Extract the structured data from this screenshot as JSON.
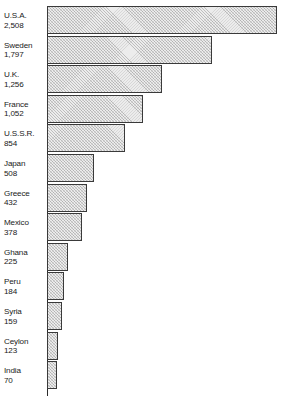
{
  "chart_data": {
    "type": "bar",
    "orientation": "horizontal",
    "title": "",
    "subtitle": "",
    "xlabel": "",
    "ylabel": "",
    "grid": false,
    "legend": null,
    "axis": {
      "baseline_value": 0,
      "xlim": [
        0,
        2508
      ]
    },
    "categories": [
      "U.S.A.",
      "Sweden",
      "U.K.",
      "France",
      "U.S.S.R.",
      "Japan",
      "Greece",
      "Mexico",
      "Ghana",
      "Peru",
      "Syria",
      "Ceylon",
      "India"
    ],
    "values": [
      2508,
      1797,
      1256,
      1052,
      854,
      508,
      432,
      378,
      225,
      184,
      159,
      123,
      70
    ],
    "value_labels": [
      "2,508",
      "1,797",
      "1,256",
      "1,052",
      "854",
      "508",
      "432",
      "378",
      "225",
      "184",
      "159",
      "123",
      "70"
    ],
    "bars": [
      {
        "name": "U.S.A.",
        "value": 2508,
        "label": "2,508"
      },
      {
        "name": "Sweden",
        "value": 1797,
        "label": "1,797"
      },
      {
        "name": "U.K.",
        "value": 1256,
        "label": "1,256"
      },
      {
        "name": "France",
        "value": 1052,
        "label": "1,052"
      },
      {
        "name": "U.S.S.R.",
        "value": 854,
        "label": "854"
      },
      {
        "name": "Japan",
        "value": 508,
        "label": "508"
      },
      {
        "name": "Greece",
        "value": 432,
        "label": "432"
      },
      {
        "name": "Mexico",
        "value": 378,
        "label": "378"
      },
      {
        "name": "Ghana",
        "value": 225,
        "label": "225"
      },
      {
        "name": "Peru",
        "value": 184,
        "label": "184"
      },
      {
        "name": "Syria",
        "value": 159,
        "label": "159"
      },
      {
        "name": "Ceylon",
        "value": 123,
        "label": "123"
      },
      {
        "name": "India",
        "value": 70,
        "label": "70"
      }
    ],
    "colors": {
      "bar_fill": "#ececec",
      "bar_hatch": "#787878",
      "bar_border": "#3a3a3a",
      "axis": "#2b2b2b",
      "text": "#1a1a1a",
      "background": "#ffffff"
    }
  },
  "layout": {
    "plot_left_px": 47,
    "plot_right_px": 277,
    "row_top_px": 6,
    "row_height_px": 29.6,
    "row_gap_px": 0,
    "bar_height_px": 28
  }
}
